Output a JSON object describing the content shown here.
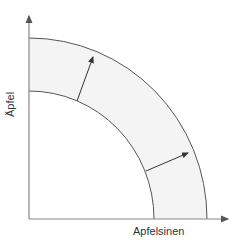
{
  "diagram": {
    "type": "production-possibility-frontier-shift",
    "x_axis_label": "Apfelsinen",
    "y_axis_label": "Äpfel",
    "curves": [
      {
        "name": "inner-frontier",
        "x_intercept": 154,
        "y_intercept": 91
      },
      {
        "name": "outer-frontier",
        "x_intercept": 207,
        "y_intercept": 38
      }
    ],
    "shift_arrows": 2,
    "colors": {
      "axis": "#888888",
      "curve": "#555555",
      "band_fill": "#f4f4f4",
      "arrow": "#333333"
    }
  }
}
